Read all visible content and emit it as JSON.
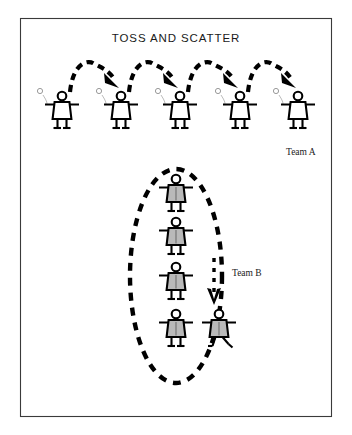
{
  "figure": {
    "title": "TOSS AND SCATTER",
    "background_color": "#ffffff",
    "border_color": "#3a3a3a",
    "ink_color": "#000000",
    "team_b_fill_color": "#b9b9b9"
  },
  "frame": {
    "x": 20,
    "y": 18,
    "width": 312,
    "height": 399
  },
  "labels": {
    "team_a": "Team A",
    "team_b": "Team B"
  },
  "team_a": {
    "label": "Team A",
    "label_x": 286,
    "label_y": 155,
    "row_y": 124,
    "player_count": 5,
    "player_x": [
      62,
      121,
      180,
      240,
      298
    ],
    "arc_count": 4,
    "arcs": [
      {
        "from_x": 62,
        "to_x": 121,
        "peak_y": 66
      },
      {
        "from_x": 121,
        "to_x": 180,
        "peak_y": 66
      },
      {
        "from_x": 180,
        "to_x": 240,
        "peak_y": 66
      },
      {
        "from_x": 240,
        "to_x": 298,
        "peak_y": 66
      }
    ]
  },
  "team_b": {
    "label": "Team B",
    "label_x": 232,
    "label_y": 276,
    "ellipse_cx": 176,
    "ellipse_cy": 276,
    "ellipse_rx": 46,
    "ellipse_ry": 107,
    "player_count": 5,
    "players": [
      {
        "x": 176,
        "y": 207,
        "state": "standing"
      },
      {
        "x": 176,
        "y": 250,
        "state": "standing"
      },
      {
        "x": 176,
        "y": 295,
        "state": "standing"
      },
      {
        "x": 176,
        "y": 342,
        "state": "standing"
      },
      {
        "x": 219,
        "y": 342,
        "state": "running"
      }
    ],
    "arrow": {
      "x": 214,
      "from_y": 258,
      "to_y": 305,
      "direction": "down"
    }
  },
  "icons": {
    "ball": "ball-icon",
    "arrow_down": "arrow-down-icon",
    "arrow_toss": "arrow-toss-icon",
    "player": "player-figure-icon"
  }
}
